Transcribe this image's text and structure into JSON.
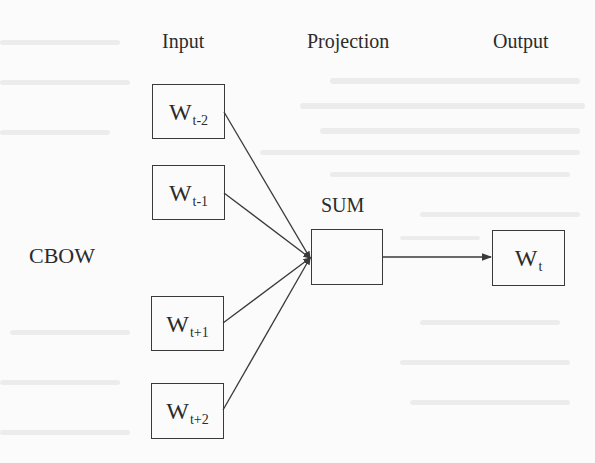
{
  "diagram": {
    "model_label": "CBOW",
    "columns": {
      "input": "Input",
      "projection": "Projection",
      "output": "Output"
    },
    "projection_node": {
      "label": "SUM"
    },
    "input_nodes": [
      {
        "base": "W",
        "sub": "t-2"
      },
      {
        "base": "W",
        "sub": "t-1"
      },
      {
        "base": "W",
        "sub": "t+1"
      },
      {
        "base": "W",
        "sub": "t+2"
      }
    ],
    "output_node": {
      "base": "W",
      "sub": "t"
    },
    "edges": [
      {
        "from": "W_t-2",
        "to": "SUM"
      },
      {
        "from": "W_t-1",
        "to": "SUM"
      },
      {
        "from": "W_t+1",
        "to": "SUM"
      },
      {
        "from": "W_t+2",
        "to": "SUM"
      },
      {
        "from": "SUM",
        "to": "W_t"
      }
    ],
    "colors": {
      "stroke": "#3a3a3a",
      "text": "#2b2b2b",
      "background": "#fbfbfb"
    }
  }
}
